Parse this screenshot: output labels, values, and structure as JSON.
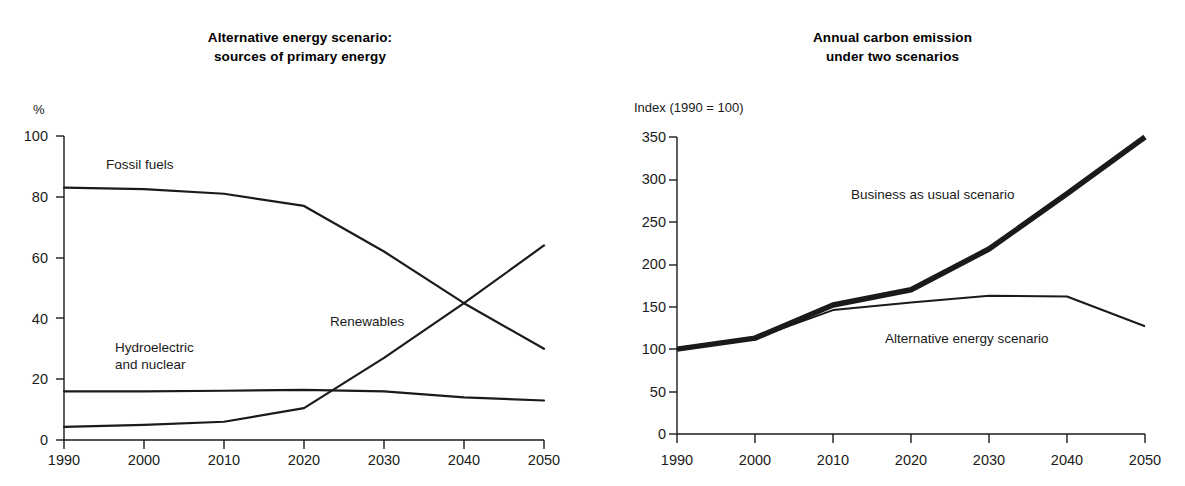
{
  "figure": {
    "background": "#ffffff",
    "ink": "#1a1a1a"
  },
  "panels": [
    {
      "id": "alternative-energy-scenario",
      "title_line1": "Alternative energy scenario:",
      "title_line2": "sources of primary energy"
    },
    {
      "id": "annual-carbon-emission",
      "title_line1": "Annual carbon emission",
      "title_line2": "under two scenarios"
    }
  ],
  "chart_data": [
    {
      "type": "line",
      "id": "alternative-energy-scenario",
      "title": "Alternative energy scenario: sources of primary energy",
      "xlabel": "",
      "ylabel": "%",
      "yunit": "%",
      "x": [
        1990,
        2000,
        2010,
        2020,
        2030,
        2040,
        2050
      ],
      "xticklabels": [
        "1990",
        "2000",
        "2010",
        "2020",
        "2030",
        "2040",
        "2050"
      ],
      "yticks": [
        0,
        20,
        40,
        60,
        80,
        100
      ],
      "yticklabels": [
        "0",
        "20",
        "40",
        "60",
        "80",
        "100"
      ],
      "xlim": [
        1990,
        2050
      ],
      "ylim": [
        0,
        100
      ],
      "grid": false,
      "legend": "inline-annotations",
      "series": [
        {
          "name": "Fossil fuels",
          "label_x": 2002,
          "label_y": 90,
          "values": [
            83,
            82.5,
            81,
            77,
            62,
            45,
            30
          ]
        },
        {
          "name": "Hydroelectric and nuclear",
          "label_x": 2003,
          "label_y": 30,
          "values": [
            16,
            16,
            16.2,
            16.5,
            16,
            14,
            13
          ]
        },
        {
          "name": "Renewables",
          "label_x": 2026,
          "label_y": 41,
          "values": [
            4.3,
            5,
            6,
            10.5,
            27,
            45,
            64
          ]
        }
      ]
    },
    {
      "type": "line",
      "id": "annual-carbon-emission",
      "title": "Annual carbon emission under two scenarios",
      "xlabel": "",
      "ylabel": "Index (1990 = 100)",
      "yunit": "Index (1990 = 100)",
      "x": [
        1990,
        2000,
        2010,
        2020,
        2030,
        2040,
        2050
      ],
      "xticklabels": [
        "1990",
        "2000",
        "2010",
        "2020",
        "2030",
        "2040",
        "2050"
      ],
      "yticks": [
        0,
        50,
        100,
        150,
        200,
        250,
        300,
        350
      ],
      "yticklabels": [
        "0",
        "50",
        "100",
        "150",
        "200",
        "250",
        "300",
        "350"
      ],
      "xlim": [
        1990,
        2050
      ],
      "ylim": [
        0,
        350
      ],
      "grid": false,
      "legend": "inline-annotations",
      "series": [
        {
          "name": "Business as usual scenario",
          "label_x": 2021,
          "label_y": 272,
          "linewidth": "thick",
          "values": [
            100,
            113,
            152,
            170,
            218,
            283,
            350
          ]
        },
        {
          "name": "Alternative energy scenario",
          "label_x": 2032,
          "label_y": 122,
          "linewidth": "thin",
          "values": [
            100,
            113,
            146,
            155,
            163,
            162,
            127
          ]
        }
      ]
    }
  ]
}
